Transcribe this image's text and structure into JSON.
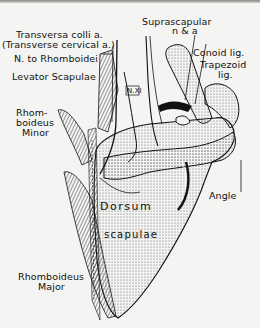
{
  "figure": {
    "colors": {
      "ink": "#111111",
      "paper": "#f4f4f2",
      "stipple": "#bdbdbd"
    },
    "labels": {
      "transversa_colli": "Transversa colli  a.",
      "transverse_cervical": "(Transverse cervical a.)",
      "n_to_rhomboidei": "N. to Rhomboidei",
      "levator_scapulae": "Levator Scapulae",
      "rhomboideus_minor_1": "Rhom-",
      "rhomboideus_minor_2": "boideus",
      "rhomboideus_minor_3": "Minor",
      "suprascapular_1": "Suprascapular",
      "suprascapular_2": "n & a",
      "conoid_lig": "Conoid lig.",
      "trapezoid_lig_1": "Trapezoid",
      "trapezoid_lig_2": "lig.",
      "n_xi": "N.XI",
      "dorsum": "Dorsum",
      "scapulae": "scapulae",
      "angle": "Angle",
      "rhomboideus_major_1": "Rhomboideus",
      "rhomboideus_major_2": "Major"
    }
  }
}
